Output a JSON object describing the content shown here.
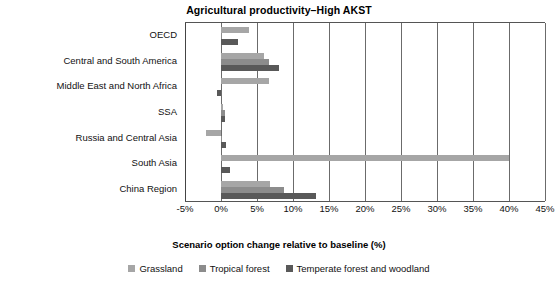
{
  "chart_data": {
    "type": "bar",
    "orientation": "horizontal",
    "title": "Agricultural productivity–High AKST",
    "xlabel": "Scenario option change relative to baseline (%)",
    "ylabel": "",
    "xlim": [
      -5,
      45
    ],
    "xticks": [
      "-5%",
      "0%",
      "5%",
      "10%",
      "15%",
      "20%",
      "25%",
      "30%",
      "35%",
      "40%",
      "45%"
    ],
    "xtick_values": [
      -5,
      0,
      5,
      10,
      15,
      20,
      25,
      30,
      35,
      40,
      45
    ],
    "grid": true,
    "legend_position": "bottom",
    "categories": [
      "OECD",
      "Central and South America",
      "Middle East and North Africa",
      "SSA",
      "Russia and Central Asia",
      "South Asia",
      "China Region"
    ],
    "series": [
      {
        "name": "Grassland",
        "color": "#a6a6a6",
        "values": [
          3.9,
          6.0,
          6.6,
          0.3,
          -2.1,
          40.0,
          6.8
        ]
      },
      {
        "name": "Tropical forest",
        "color": "#8c8c8c",
        "values": [
          0.1,
          6.6,
          0.0,
          0.5,
          0.2,
          0.0,
          8.8
        ]
      },
      {
        "name": "Temperate forest and woodland",
        "color": "#595959",
        "values": [
          2.4,
          8.0,
          -0.5,
          0.6,
          0.7,
          1.3,
          13.2
        ]
      }
    ]
  },
  "legend": {
    "entries": [
      {
        "label": "Grassland",
        "color": "#a6a6a6"
      },
      {
        "label": "Tropical forest",
        "color": "#8c8c8c"
      },
      {
        "label": "Temperate forest and woodland",
        "color": "#595959"
      }
    ]
  }
}
